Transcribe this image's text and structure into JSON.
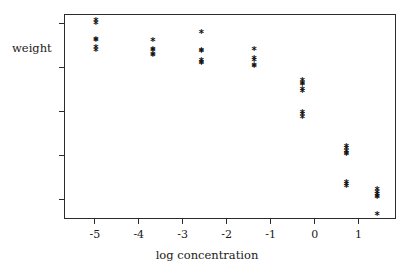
{
  "chart_data": {
    "type": "scatter",
    "title": "",
    "xlabel": "log concentration",
    "ylabel": "weight",
    "xlim": [
      -5.7,
      1.85
    ],
    "ylim": [
      110,
      1045
    ],
    "grid": false,
    "legend": null,
    "marker": "*",
    "xticks": [
      -5,
      -4,
      -3,
      -2,
      -1,
      0,
      1
    ],
    "xtick_labels": [
      "-5",
      "-4",
      "-3",
      "-2",
      "-1",
      "0",
      "1"
    ],
    "yticks": [
      200,
      400,
      600,
      800,
      1000
    ],
    "ytick_labels": [
      "200",
      "400",
      "600",
      "800",
      "1000"
    ],
    "series": [
      {
        "name": "weight vs log concentration",
        "points": [
          {
            "x": -5.0,
            "y": 1015
          },
          {
            "x": -5.0,
            "y": 1000
          },
          {
            "x": -5.0,
            "y": 930
          },
          {
            "x": -5.0,
            "y": 925
          },
          {
            "x": -5.0,
            "y": 890
          },
          {
            "x": -5.0,
            "y": 878
          },
          {
            "x": -3.7,
            "y": 922
          },
          {
            "x": -3.7,
            "y": 885
          },
          {
            "x": -3.7,
            "y": 878
          },
          {
            "x": -3.7,
            "y": 862
          },
          {
            "x": -3.7,
            "y": 855
          },
          {
            "x": -2.6,
            "y": 962
          },
          {
            "x": -2.6,
            "y": 880
          },
          {
            "x": -2.6,
            "y": 873
          },
          {
            "x": -2.6,
            "y": 832
          },
          {
            "x": -2.6,
            "y": 825
          },
          {
            "x": -2.6,
            "y": 818
          },
          {
            "x": -1.4,
            "y": 885
          },
          {
            "x": -1.4,
            "y": 840
          },
          {
            "x": -1.4,
            "y": 832
          },
          {
            "x": -1.4,
            "y": 812
          },
          {
            "x": -1.4,
            "y": 805
          },
          {
            "x": -0.3,
            "y": 742
          },
          {
            "x": -0.3,
            "y": 730
          },
          {
            "x": -0.3,
            "y": 722
          },
          {
            "x": -0.3,
            "y": 700
          },
          {
            "x": -0.3,
            "y": 693
          },
          {
            "x": -0.3,
            "y": 598
          },
          {
            "x": -0.3,
            "y": 588
          },
          {
            "x": -0.3,
            "y": 572
          },
          {
            "x": 0.7,
            "y": 440
          },
          {
            "x": 0.7,
            "y": 432
          },
          {
            "x": 0.7,
            "y": 420
          },
          {
            "x": 0.7,
            "y": 408
          },
          {
            "x": 0.7,
            "y": 402
          },
          {
            "x": 0.7,
            "y": 275
          },
          {
            "x": 0.7,
            "y": 268
          },
          {
            "x": 0.7,
            "y": 258
          },
          {
            "x": 1.4,
            "y": 245
          },
          {
            "x": 1.4,
            "y": 232
          },
          {
            "x": 1.4,
            "y": 222
          },
          {
            "x": 1.4,
            "y": 214
          },
          {
            "x": 1.4,
            "y": 206
          },
          {
            "x": 1.4,
            "y": 130
          }
        ]
      }
    ]
  },
  "axes": {
    "y_title": "weight",
    "x_title": "log concentration"
  }
}
